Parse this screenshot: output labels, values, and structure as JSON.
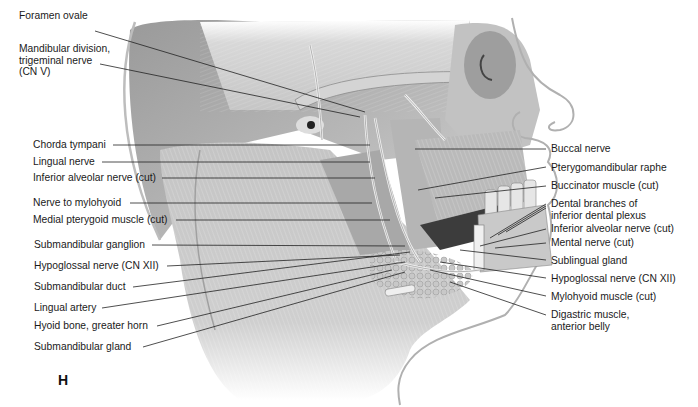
{
  "figure": {
    "panel_letter": "H",
    "left_labels": [
      {
        "id": "foramen-ovale",
        "text": "Foramen ovale"
      },
      {
        "id": "mandibular-division",
        "text": "Mandibular division,\ntrigeminal nerve\n(CN V)"
      },
      {
        "id": "chorda-tympani",
        "text": "Chorda tympani"
      },
      {
        "id": "lingual-nerve",
        "text": "Lingual nerve"
      },
      {
        "id": "inferior-alveolar-nerve-left",
        "text": "Inferior alveolar nerve (cut)"
      },
      {
        "id": "nerve-to-mylohyoid",
        "text": "Nerve to mylohyoid"
      },
      {
        "id": "medial-pterygoid",
        "text": "Medial pterygoid muscle (cut)"
      },
      {
        "id": "submandibular-ganglion",
        "text": "Submandibular ganglion"
      },
      {
        "id": "hypoglossal-nerve-left",
        "text": "Hypoglossal nerve (CN XII)"
      },
      {
        "id": "submandibular-duct",
        "text": "Submandibular duct"
      },
      {
        "id": "lingual-artery",
        "text": "Lingual artery"
      },
      {
        "id": "hyoid-bone",
        "text": "Hyoid bone, greater horn"
      },
      {
        "id": "submandibular-gland",
        "text": "Submandibular gland"
      }
    ],
    "right_labels": [
      {
        "id": "buccal-nerve",
        "text": "Buccal nerve"
      },
      {
        "id": "pterygomandibular-raphe",
        "text": "Pterygomandibular raphe"
      },
      {
        "id": "buccinator-muscle",
        "text": "Buccinator muscle (cut)"
      },
      {
        "id": "dental-branches",
        "text": "Dental branches of\ninferior dental plexus"
      },
      {
        "id": "inferior-alveolar-nerve-right",
        "text": "Inferior alveolar nerve (cut)"
      },
      {
        "id": "mental-nerve",
        "text": "Mental nerve (cut)"
      },
      {
        "id": "sublingual-gland",
        "text": "Sublingual gland"
      },
      {
        "id": "hypoglossal-nerve-right",
        "text": "Hypoglossal nerve (CN XII)"
      },
      {
        "id": "mylohyoid-muscle",
        "text": "Mylohyoid muscle (cut)"
      },
      {
        "id": "digastric-muscle",
        "text": "Digastric muscle,\nanterior belly"
      }
    ]
  }
}
